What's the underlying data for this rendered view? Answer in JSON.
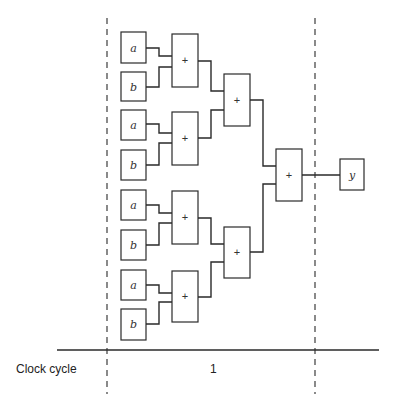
{
  "diagram": {
    "type": "adder-tree",
    "inputs": [
      {
        "id": "a1",
        "label": "a"
      },
      {
        "id": "b1",
        "label": "b"
      },
      {
        "id": "a2",
        "label": "a"
      },
      {
        "id": "b2",
        "label": "b"
      },
      {
        "id": "a3",
        "label": "a"
      },
      {
        "id": "b3",
        "label": "b"
      },
      {
        "id": "a4",
        "label": "a"
      },
      {
        "id": "b4",
        "label": "b"
      }
    ],
    "adders": {
      "level1": [
        {
          "label": "+"
        },
        {
          "label": "+"
        },
        {
          "label": "+"
        },
        {
          "label": "+"
        }
      ],
      "level2": [
        {
          "label": "+"
        },
        {
          "label": "+"
        }
      ],
      "level3": [
        {
          "label": "+"
        }
      ]
    },
    "output": {
      "label": "y"
    }
  },
  "timeline": {
    "row_label": "Clock cycle",
    "cycles": [
      "1"
    ]
  }
}
